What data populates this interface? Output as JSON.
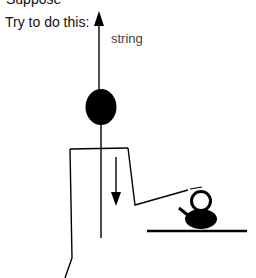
{
  "diagram": {
    "cutoff_text": "Suppose",
    "instruction": "Try to do this:",
    "string_label": "string",
    "colors": {
      "ink": "#000000",
      "text": "#111111",
      "label": "#444444",
      "background": "#ffffff"
    },
    "elements": [
      {
        "name": "up-arrow",
        "meaning": "string pulling upward"
      },
      {
        "name": "head",
        "meaning": "stick figure head"
      },
      {
        "name": "body-line",
        "meaning": "vertical string/body"
      },
      {
        "name": "down-arrow",
        "meaning": "downward force"
      },
      {
        "name": "shoulders",
        "meaning": "shoulder line"
      },
      {
        "name": "left-arm",
        "meaning": "left arm hanging down"
      },
      {
        "name": "right-arm",
        "meaning": "right arm reaching to kettle"
      },
      {
        "name": "kettle",
        "meaning": "kettle on table"
      },
      {
        "name": "table",
        "meaning": "table surface"
      }
    ]
  }
}
